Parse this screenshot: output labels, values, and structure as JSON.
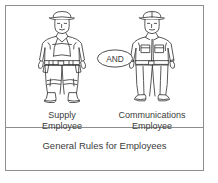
{
  "diagram": {
    "title_caption": "General Rules for Employees",
    "operator_badge": "AND",
    "frame_color": "#8d8d8d",
    "ink_color": "#3b3b3b",
    "background_color": "#ffffff",
    "nodes": [
      {
        "id": "supply-employee",
        "label_line1": "Supply",
        "label_line2": "Employee",
        "icon": "worker-with-harness-and-tool-belt-icon"
      },
      {
        "id": "communications-employee",
        "label_line1": "Communications",
        "label_line2": "Employee",
        "icon": "worker-with-uniform-shirt-icon"
      }
    ]
  }
}
